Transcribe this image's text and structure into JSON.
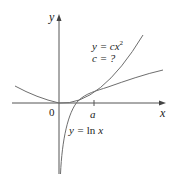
{
  "diagram": {
    "axes": {
      "x_label": "x",
      "y_label": "y",
      "origin_label": "0",
      "tick_label": "a"
    },
    "curves": [
      {
        "name": "parabola",
        "equation_lhs": "y = c",
        "equation_var": "x",
        "equation_exp": "2",
        "note": "c = ?"
      },
      {
        "name": "logarithm",
        "equation": "y = ln x",
        "lhs": "y = ",
        "fn": "ln ",
        "var": "x"
      }
    ],
    "colors": {
      "curve": "#6e6e6e",
      "axis": "#555555",
      "text": "#1a1a1a"
    }
  }
}
